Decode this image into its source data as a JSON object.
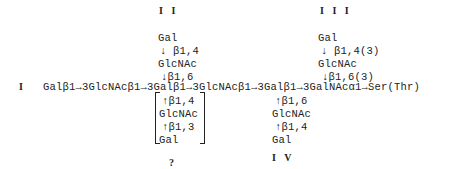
{
  "labels": {
    "I": "I",
    "II": "I I",
    "III": "I I I",
    "IV": "I V",
    "unknown": "?"
  },
  "main_chain": "Galβ1→3GlcNAcβ1→3Galβ1→3GlcNAcβ1→3Galβ1→3GalNAcα1→Ser(Thr)",
  "branch_II": {
    "residue_top": "Gal",
    "linkage_1": "↓ β1,4",
    "residue_mid": "GlcNAc",
    "linkage_2": "↓β1,6"
  },
  "branch_III": {
    "residue_top": "Gal",
    "linkage_1": "↓ β1,4(3)",
    "residue_mid": "GlcNAc",
    "linkage_2": "↓β1,6(3)"
  },
  "branch_bracket": {
    "linkage_1": "↑β1,4",
    "residue_mid": "GlcNAc",
    "linkage_2": "↑β1,3",
    "residue_bottom": "Gal"
  },
  "branch_IV": {
    "linkage_1": "↑β1,6",
    "residue_mid": "GlcNAc",
    "linkage_2": "↑β1,4",
    "residue_bottom": "Gal"
  }
}
